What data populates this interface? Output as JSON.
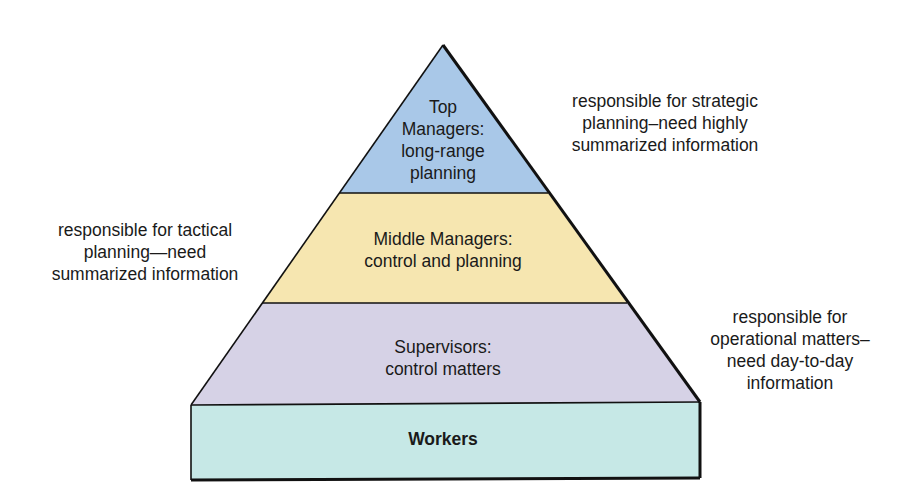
{
  "diagram": {
    "type": "pyramid",
    "levels": [
      {
        "name": "top",
        "lines": [
          "Top",
          "Managers:",
          "long-range",
          "planning"
        ],
        "color": "#a9c8e8"
      },
      {
        "name": "middle",
        "lines": [
          "Middle Managers:",
          "control and planning"
        ],
        "color": "#f6e6b0"
      },
      {
        "name": "supervisors",
        "lines": [
          "Supervisors:",
          "control matters"
        ],
        "color": "#d6d2e6"
      },
      {
        "name": "workers",
        "lines": [
          "Workers"
        ],
        "color": "#c6e8e6"
      }
    ],
    "annotations": {
      "top_right": [
        "responsible for strategic",
        "planning–need highly",
        "summarized information"
      ],
      "middle_left": [
        "responsible for tactical",
        "planning—need",
        "summarized information"
      ],
      "lower_right": [
        "responsible for",
        "operational matters–",
        "need day-to-day",
        "information"
      ]
    },
    "outline_color": "#111111"
  }
}
